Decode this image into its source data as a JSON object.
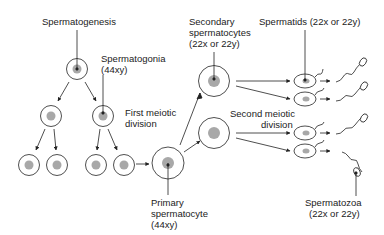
{
  "diagram": {
    "title": "Spermatogenesis",
    "labels": {
      "spermatogenesis": "Spermatogenesis",
      "spermatogonia": "Spermatogonia",
      "spermatogonia_chrom": "(44xy)",
      "first_meiotic_1": "First meiotic",
      "first_meiotic_2": "division",
      "primary_1": "Primary",
      "primary_2": "spermatocyte",
      "primary_chrom": "(44xy)",
      "secondary_1": "Secondary",
      "secondary_2": "spermatocytes",
      "secondary_chrom": "(22x or 22y)",
      "spermatids": "Spermatids (22x or 22y)",
      "second_meiotic_1": "Second meiotic",
      "second_meiotic_2": "division",
      "spermatozoa": "Spermatozoa",
      "spermatozoa_chrom": "(22x or 22y)"
    },
    "colors": {
      "line": "#222222",
      "nucleus": "#a8a8a8",
      "background": "#ffffff"
    }
  }
}
